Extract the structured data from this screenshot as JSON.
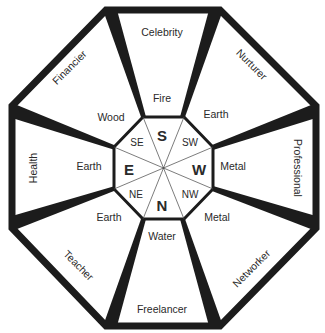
{
  "diagram": {
    "colors": {
      "stroke": "#1c1c1c",
      "background": "#ffffff",
      "text": "#2a2a2a"
    },
    "sectors": [
      {
        "id": "south",
        "direction": "S",
        "direction_size": "big",
        "element": "Fire",
        "role": "Celebrity"
      },
      {
        "id": "southwest",
        "direction": "SW",
        "direction_size": "small",
        "element": "Earth",
        "role": "Nurturer"
      },
      {
        "id": "west",
        "direction": "W",
        "direction_size": "big",
        "element": "Metal",
        "role": "Professional"
      },
      {
        "id": "northwest",
        "direction": "NW",
        "direction_size": "small",
        "element": "Metal",
        "role": "Networker"
      },
      {
        "id": "north",
        "direction": "N",
        "direction_size": "big",
        "element": "Water",
        "role": "Freelancer"
      },
      {
        "id": "northeast",
        "direction": "NE",
        "direction_size": "small",
        "element": "Earth",
        "role": "Teacher"
      },
      {
        "id": "east",
        "direction": "E",
        "direction_size": "big",
        "element": "Earth",
        "role": "Health"
      },
      {
        "id": "southeast",
        "direction": "SE",
        "direction_size": "small",
        "element": "Wood",
        "role": "Financier"
      }
    ]
  }
}
